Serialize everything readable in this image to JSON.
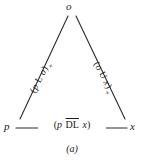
{
  "figure": {
    "caption": "(a)",
    "vertices": [
      {
        "id": "o",
        "label": "o",
        "position": "top"
      },
      {
        "id": "p",
        "label": "p",
        "position": "bottom-left"
      },
      {
        "id": "x",
        "label": "x",
        "position": "bottom-right"
      }
    ],
    "edges": [
      {
        "id": "left-leg",
        "from": "p",
        "to": "o",
        "label_text": "(p L o)+",
        "label_parts": {
          "open": "(",
          "left_operand": "p",
          "relation": "L",
          "right_operand": "o",
          "close": ")",
          "superscript": "+"
        }
      },
      {
        "id": "right-leg",
        "from": "o",
        "to": "x",
        "label_text": "(o U x)+",
        "label_parts": {
          "open": "(",
          "left_operand": "o",
          "relation": "U",
          "right_operand": "x",
          "close": ")",
          "superscript": "+"
        }
      },
      {
        "id": "base",
        "from": "p",
        "to": "x",
        "label_text": "(p DL x)",
        "label_parts": {
          "open": "(",
          "left_operand": "p",
          "relation": "DL",
          "relation_overline": true,
          "right_operand": "x",
          "close": ")",
          "superscript": ""
        }
      }
    ],
    "colors": {
      "line": "#2b2b2b",
      "text": "#1a1a1a",
      "background": "#ffffff"
    }
  }
}
